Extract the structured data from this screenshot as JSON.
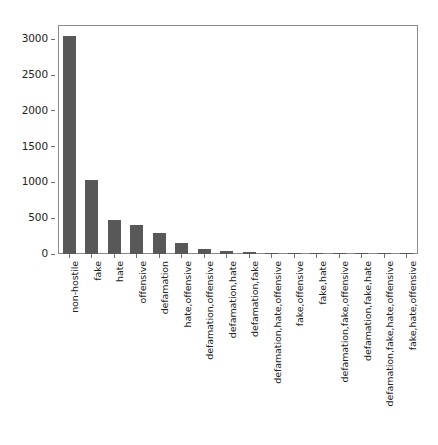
{
  "chart_data": {
    "type": "bar",
    "title": "",
    "xlabel": "",
    "ylabel": "",
    "grid": false,
    "legend": false,
    "orientation": "vertical",
    "bar_color": "#585858",
    "axis_color": "#8a8a8a",
    "ylim": [
      0,
      3200
    ],
    "yticks": [
      0,
      500,
      1000,
      1500,
      2000,
      2500,
      3000
    ],
    "ytick_labels": [
      "0",
      "500",
      "1000",
      "1500",
      "2000",
      "2500",
      "3000"
    ],
    "categories": [
      "non-hostile",
      "fake",
      "hate",
      "offensive",
      "defamation",
      "hate,offensive",
      "defamation,offensive",
      "defamation,hate",
      "defamation,fake",
      "defamation,hate,offensive",
      "fake,offensive",
      "fake,hate",
      "defamation,fake,offensive",
      "defamation,fake,hate",
      "defamation,fake,hate,offensive",
      "fake,hate,offensive"
    ],
    "values": [
      3050,
      1030,
      480,
      400,
      290,
      150,
      70,
      48,
      25,
      14,
      12,
      9,
      7,
      5,
      4,
      3
    ]
  }
}
